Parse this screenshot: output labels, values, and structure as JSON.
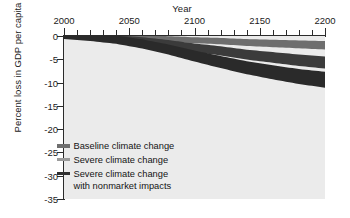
{
  "chart_data": {
    "type": "line",
    "title": "",
    "xlabel": "Year",
    "ylabel": "Percent loss in GDP per capita",
    "xlim": [
      2000,
      2200
    ],
    "ylim": [
      -35,
      0
    ],
    "xticks": [
      2000,
      2050,
      2100,
      2150,
      2200
    ],
    "xticklabels": [
      "2000",
      "2050",
      "2100",
      "2150",
      "2200"
    ],
    "xminor_step": 10,
    "yticks": [
      0,
      -5,
      -10,
      -15,
      -20,
      -25,
      -30,
      -35
    ],
    "yticklabels": [
      "0",
      "-5",
      "-10",
      "-15",
      "-20",
      "-25",
      "-30",
      "-35"
    ],
    "grid": false,
    "legend_position": "lower-left-inside",
    "plot_background": "#ebebeb",
    "series": [
      {
        "name": "Baseline climate change",
        "color": "#6e6e6e",
        "x": [
          2000,
          2020,
          2040,
          2060,
          2080,
          2100,
          2120,
          2140,
          2160,
          2180,
          2200
        ],
        "values": [
          0,
          -0.1,
          -0.2,
          -0.4,
          -0.6,
          -0.9,
          -1.1,
          -1.4,
          -1.6,
          -1.8,
          -2.0
        ]
      },
      {
        "name": "Severe climate change",
        "color": "#3b3b3b",
        "x": [
          2000,
          2020,
          2040,
          2060,
          2080,
          2100,
          2120,
          2140,
          2160,
          2180,
          2200
        ],
        "values": [
          0,
          -0.2,
          -0.5,
          -1.0,
          -1.7,
          -2.5,
          -3.2,
          -4.0,
          -4.6,
          -5.2,
          -5.7
        ]
      },
      {
        "name": "Severe climate change with nonmarket impacts",
        "color": "#2a2a2a",
        "x": [
          2000,
          2020,
          2040,
          2060,
          2080,
          2100,
          2120,
          2140,
          2160,
          2180,
          2200
        ],
        "values": [
          0,
          -0.3,
          -0.8,
          -1.7,
          -2.9,
          -4.3,
          -5.6,
          -6.8,
          -7.8,
          -8.7,
          -9.4
        ]
      }
    ]
  },
  "axes": {
    "x_title": "Year",
    "y_title": "Percent loss in GDP per capita"
  },
  "legend": {
    "items": [
      {
        "label": "Baseline climate change",
        "label2": "",
        "color": "#6e6e6e"
      },
      {
        "label": "Severe climate change",
        "label2": "",
        "color": "#9a9a9a"
      },
      {
        "label": "Severe climate change",
        "label2": "with nonmarket impacts",
        "color": "#2f2f2f"
      }
    ]
  }
}
